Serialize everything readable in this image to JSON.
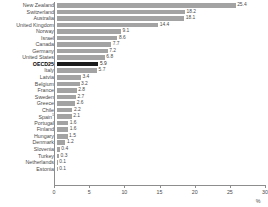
{
  "chart_data": {
    "type": "bar",
    "orientation": "horizontal",
    "title": "",
    "xlabel": "%",
    "ylabel": "",
    "xlim": [
      0,
      30
    ],
    "xticks": [
      0,
      5,
      10,
      15,
      20,
      25,
      30
    ],
    "grid": false,
    "legend": null,
    "highlight_category": "OECD25",
    "colors": {
      "bar": "#a3a3a3",
      "highlight_bar": "#1c1c1c",
      "axis": "#8d8d8d",
      "text": "#4a4a4a"
    },
    "categories": [
      "New Zealand",
      "Switzerland",
      "Australia",
      "United Kingdom",
      "Norway",
      "Israel",
      "Canada",
      "Germany",
      "United States",
      "OECD25",
      "Italy",
      "Latvia",
      "Belgium",
      "France",
      "Sweden",
      "Greece",
      "Chile",
      "Spain",
      "Portugal",
      "Finland",
      "Hungary",
      "Denmark",
      "Slovenia",
      "Turkey",
      "Netherlands",
      "Estonia"
    ],
    "values": [
      25.4,
      18.2,
      18.1,
      14.4,
      9.1,
      8.6,
      7.7,
      7.2,
      6.8,
      5.9,
      5.7,
      3.4,
      3.2,
      2.8,
      2.7,
      2.6,
      2.2,
      2.1,
      1.6,
      1.6,
      1.5,
      1.2,
      0.4,
      0.3,
      0.1,
      0.1
    ],
    "value_labels": [
      "25.4",
      "18.2",
      "18.1",
      "14.4",
      "9.1",
      "8.6",
      "7.7",
      "7.2",
      "6.8",
      "5.9",
      "5.7",
      "3.4",
      "3.2",
      "2.8",
      "2.7",
      "2.6",
      "2.2",
      "2.1",
      "1.6",
      "1.6",
      "1.5",
      "1.2",
      "0.4",
      "0.3",
      "0.1",
      "0.1"
    ],
    "footnote_markers": {
      "Spain": "1"
    }
  }
}
